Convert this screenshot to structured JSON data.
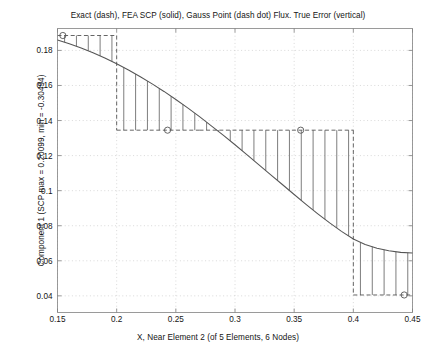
{
  "chart_data": {
    "type": "line",
    "title": "Exact (dash), FEA SCP (solid), Gauss Point (dash dot) Flux. True Error (vertical)",
    "xlabel": "X, Near Element 2 (of 5 Elements, 6 Nodes)",
    "ylabel": "Component 1 (SCP max = 0.20099, min = -0.30494)",
    "xlim": [
      0.15,
      0.45
    ],
    "ylim": [
      0.0305,
      0.1925
    ],
    "xticks": [
      0.15,
      0.2,
      0.25,
      0.3,
      0.35,
      0.4,
      0.45
    ],
    "xtick_labels": [
      "0.15",
      "0.2",
      "0.25",
      "0.3",
      "0.35",
      "0.4",
      "0.45"
    ],
    "yticks": [
      0.04,
      0.06,
      0.08,
      0.1,
      0.12,
      0.14,
      0.16,
      0.18
    ],
    "ytick_labels": [
      "0.04",
      "0.06",
      "0.08",
      "0.1",
      "0.12",
      "0.14",
      "0.16",
      "0.18"
    ],
    "grid": true,
    "grid_style": "dotted",
    "legend": null,
    "series": [
      {
        "name": "FEA SCP (solid)",
        "style": "solid",
        "color": "#555555",
        "x": [
          0.15,
          0.16,
          0.17,
          0.18,
          0.19,
          0.2,
          0.21,
          0.22,
          0.23,
          0.24,
          0.25,
          0.26,
          0.27,
          0.28,
          0.29,
          0.3,
          0.31,
          0.32,
          0.33,
          0.34,
          0.35,
          0.36,
          0.37,
          0.38,
          0.39,
          0.4,
          0.41,
          0.42,
          0.43,
          0.44,
          0.45
        ],
        "y": [
          0.186,
          0.1838,
          0.1814,
          0.1787,
          0.1757,
          0.1724,
          0.1688,
          0.165,
          0.1609,
          0.1566,
          0.152,
          0.1472,
          0.1422,
          0.137,
          0.1317,
          0.1262,
          0.1206,
          0.1149,
          0.1092,
          0.1035,
          0.0978,
          0.0922,
          0.0868,
          0.0816,
          0.0768,
          0.0724,
          0.0693,
          0.0672,
          0.0657,
          0.0648,
          0.0645
        ]
      },
      {
        "name": "Exact (dash) step",
        "style": "dashed",
        "color": "#555555",
        "segments": [
          {
            "x_start": 0.15,
            "x_end": 0.2,
            "y": 0.1885
          },
          {
            "x_start": 0.2,
            "x_end": 0.27,
            "y": 0.1345
          },
          {
            "x_start": 0.27,
            "x_end": 0.4,
            "y": 0.1345
          },
          {
            "x_start": 0.4,
            "x_end": 0.45,
            "y": 0.0405
          }
        ]
      },
      {
        "name": "Gauss Point (dash dot)",
        "style": "dashdot",
        "color": "#555555",
        "markers": [
          {
            "x": 0.1545,
            "y": 0.1885
          },
          {
            "x": 0.243,
            "y": 0.1345
          },
          {
            "x": 0.3555,
            "y": 0.1345
          },
          {
            "x": 0.443,
            "y": 0.0405
          }
        ]
      }
    ],
    "error_bars": {
      "name": "True Error (vertical)",
      "color": "#666666",
      "x": [
        0.156,
        0.166,
        0.176,
        0.186,
        0.196,
        0.206,
        0.216,
        0.226,
        0.236,
        0.246,
        0.256,
        0.266,
        0.276,
        0.286,
        0.296,
        0.306,
        0.316,
        0.326,
        0.336,
        0.346,
        0.356,
        0.366,
        0.376,
        0.386,
        0.396,
        0.406,
        0.416,
        0.426,
        0.436,
        0.446
      ]
    },
    "element_boundaries": [
      0.2,
      0.4
    ],
    "axes_color": "#808080",
    "grid_color": "#c8c8c8",
    "background": "#ffffff"
  }
}
